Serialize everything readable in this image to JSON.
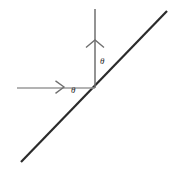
{
  "figure": {
    "background_color": "#ffffff",
    "width": 169,
    "height": 172,
    "labels": {
      "theta_between_horizontal_and_incline": "θ",
      "theta_between_vertical_and_incline": "θ"
    },
    "colors": {
      "incline_line": "#2b2b2b",
      "horizontal_axis": "#9a9a9a",
      "vertical_axis": "#6f6f6f",
      "arrow_head": "#6f6f6f",
      "label_text": "#2b2b2b"
    },
    "elements": {
      "incline_line_name": "incline-line",
      "horizontal_axis_name": "horizontal-reference-line",
      "vertical_axis_name": "vertical-reference-line",
      "horizontal_arrow_name": "horizontal-arrowhead",
      "vertical_arrow_name": "vertical-arrowhead",
      "origin_name": "origin-point"
    }
  },
  "chart_data": {
    "type": "line",
    "xlabel": "",
    "ylabel": "",
    "xlim": [
      0,
      169
    ],
    "ylim": [
      172,
      0
    ],
    "grid": false,
    "legend": "none",
    "origin": {
      "x": 95,
      "y": 88
    },
    "series": [
      {
        "name": "incline-line",
        "kind": "segment",
        "color": "#2b2b2b",
        "width": 2.2,
        "points": [
          {
            "x": 21,
            "y": 162
          },
          {
            "x": 167,
            "y": 11
          }
        ],
        "slope_degrees": 45.9
      },
      {
        "name": "horizontal-reference-line",
        "kind": "segment",
        "color": "#9a9a9a",
        "width": 1.4,
        "points": [
          {
            "x": 17,
            "y": 88
          },
          {
            "x": 95,
            "y": 88
          }
        ],
        "slope_degrees": 0
      },
      {
        "name": "vertical-reference-line",
        "kind": "segment",
        "color": "#6f6f6f",
        "width": 1.4,
        "points": [
          {
            "x": 95,
            "y": 9
          },
          {
            "x": 95,
            "y": 88
          }
        ],
        "slope_degrees": 90
      }
    ],
    "annotations": [
      {
        "name": "horizontal-arrowhead",
        "kind": "chevron",
        "direction": "right",
        "tip": {
          "x": 64,
          "y": 87
        },
        "color": "#6f6f6f"
      },
      {
        "name": "vertical-arrowhead",
        "kind": "chevron",
        "direction": "up",
        "tip": {
          "x": 95,
          "y": 40
        },
        "color": "#6f6f6f"
      },
      {
        "name": "theta-between-horizontal-and-incline",
        "text": "θ",
        "x": 75,
        "y": 92
      },
      {
        "name": "theta-between-vertical-and-incline",
        "text": "θ",
        "x": 103,
        "y": 63
      }
    ]
  }
}
